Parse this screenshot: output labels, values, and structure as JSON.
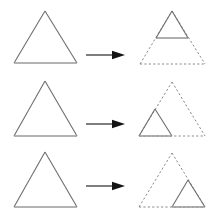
{
  "figure": {
    "canvas": {
      "width": 213,
      "height": 217,
      "background": "#ffffff"
    },
    "colors": {
      "solid_stroke": "#6e6e6e",
      "base_stroke": "#9a9a9a",
      "dashed_stroke": "#8a8a8a",
      "arrow": "#141414"
    },
    "rows": [
      {
        "id": "row-1",
        "label": "Top sub-triangle",
        "source": {
          "label": "Large triangle",
          "style": "solid",
          "apex": {
            "x": 45,
            "y": 11
          },
          "left": {
            "x": 14,
            "y": 63
          },
          "right": {
            "x": 77,
            "y": 63
          }
        },
        "arrow": {
          "label": "transforms to",
          "shaft_start_x": 86,
          "shaft_end_x": 113,
          "tip_x": 125,
          "y": 55
        },
        "result": {
          "outline": {
            "label": "Dashed large triangle",
            "style": "dashed",
            "apex": {
              "x": 172,
              "y": 11
            },
            "left": {
              "x": 140,
              "y": 64
            },
            "right": {
              "x": 205,
              "y": 64
            }
          },
          "sub_triangle": {
            "label": "Solid sub-triangle at top",
            "style": "solid",
            "position": "top",
            "apex": {
              "x": 172,
              "y": 11
            },
            "left": {
              "x": 156,
              "y": 38
            },
            "right": {
              "x": 188,
              "y": 38
            }
          }
        }
      },
      {
        "id": "row-2",
        "label": "Bottom-left sub-triangle",
        "source": {
          "label": "Large triangle",
          "style": "solid",
          "apex": {
            "x": 45,
            "y": 81
          },
          "left": {
            "x": 14,
            "y": 136
          },
          "right": {
            "x": 77,
            "y": 136
          }
        },
        "arrow": {
          "label": "transforms to",
          "shaft_start_x": 86,
          "shaft_end_x": 113,
          "tip_x": 125,
          "y": 124
        },
        "result": {
          "outline": {
            "label": "Dashed large triangle",
            "style": "dashed",
            "apex": {
              "x": 172,
              "y": 82
            },
            "left": {
              "x": 139,
              "y": 136
            },
            "right": {
              "x": 205,
              "y": 136
            }
          },
          "sub_triangle": {
            "label": "Solid sub-triangle at bottom left",
            "style": "solid",
            "position": "bottom-left",
            "apex": {
              "x": 155,
              "y": 109
            },
            "left": {
              "x": 139,
              "y": 136
            },
            "right": {
              "x": 172,
              "y": 136
            }
          }
        }
      },
      {
        "id": "row-3",
        "label": "Bottom-right sub-triangle",
        "source": {
          "label": "Large triangle",
          "style": "solid",
          "apex": {
            "x": 45,
            "y": 152
          },
          "left": {
            "x": 14,
            "y": 207
          },
          "right": {
            "x": 77,
            "y": 207
          }
        },
        "arrow": {
          "label": "transforms to",
          "shaft_start_x": 86,
          "shaft_end_x": 113,
          "tip_x": 125,
          "y": 186
        },
        "result": {
          "outline": {
            "label": "Dashed large triangle",
            "style": "dashed",
            "apex": {
              "x": 172,
              "y": 153
            },
            "left": {
              "x": 139,
              "y": 207
            },
            "right": {
              "x": 205,
              "y": 207
            }
          },
          "sub_triangle": {
            "label": "Solid sub-triangle at bottom right",
            "style": "solid",
            "position": "bottom-right",
            "apex": {
              "x": 188,
              "y": 180
            },
            "left": {
              "x": 172,
              "y": 207
            },
            "right": {
              "x": 205,
              "y": 207
            }
          }
        }
      }
    ]
  }
}
